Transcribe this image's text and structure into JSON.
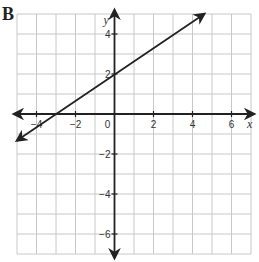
{
  "panel_label": "B",
  "chart_data": {
    "type": "line",
    "title": "",
    "xlabel": "x",
    "ylabel": "y",
    "xlim": [
      -5,
      7
    ],
    "ylim": [
      -7,
      5
    ],
    "grid": true,
    "grid_step": 1,
    "x_ticks": [
      -4,
      -2,
      0,
      2,
      4,
      6
    ],
    "x_tick_labels": [
      "−4",
      "−2",
      "0",
      "2",
      "4",
      "6"
    ],
    "y_ticks": [
      4,
      2,
      -2,
      -4,
      -6
    ],
    "y_tick_labels": [
      "4",
      "2",
      "−2",
      "−4",
      "−6"
    ],
    "series": [
      {
        "name": "line",
        "equation": "y = (2/3)x + 2",
        "slope": 0.6667,
        "intercept": 2,
        "x_intercept": -3,
        "points": [
          [
            -3,
            0
          ],
          [
            0,
            2
          ],
          [
            3,
            4
          ]
        ],
        "arrows_both_ends": true,
        "start": [
          -5,
          -1.33
        ],
        "end": [
          4.6,
          5
        ]
      }
    ]
  },
  "colors": {
    "grid": "#c8c8c8",
    "axis": "#222222",
    "line": "#222222"
  }
}
